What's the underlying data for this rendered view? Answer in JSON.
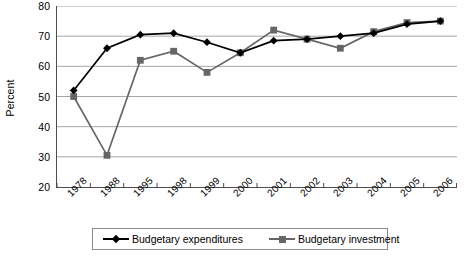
{
  "chart_data": {
    "type": "line",
    "title": "",
    "xlabel": "",
    "ylabel": "Percent",
    "categories": [
      "1978",
      "1988",
      "1995",
      "1998",
      "1999",
      "2000",
      "2001",
      "2002",
      "2003",
      "2004",
      "2005",
      "2006"
    ],
    "ylim": [
      20,
      80
    ],
    "yticks": [
      20,
      30,
      40,
      50,
      60,
      70,
      80
    ],
    "grid": "horizontal",
    "legend_position": "bottom",
    "series": [
      {
        "name": "Budgetary expenditures",
        "color": "#000000",
        "marker": "diamond",
        "values": [
          52,
          66,
          70.5,
          71,
          68,
          64.5,
          68.5,
          69,
          70,
          71,
          74,
          75
        ]
      },
      {
        "name": "Budgetary investment",
        "color": "#666666",
        "marker": "square",
        "values": [
          50,
          30.5,
          62,
          65,
          58,
          64.5,
          72,
          69,
          66,
          71.5,
          74.5,
          75
        ]
      }
    ]
  },
  "legend": {
    "entries": [
      {
        "label": "Budgetary expenditures"
      },
      {
        "label": "Budgetary investment"
      }
    ]
  },
  "colors": {
    "series_expenditures": "#000000",
    "series_investment": "#666666",
    "gridline": "#a6a6a6",
    "axis": "#4d4d4d",
    "background": "#ffffff"
  }
}
